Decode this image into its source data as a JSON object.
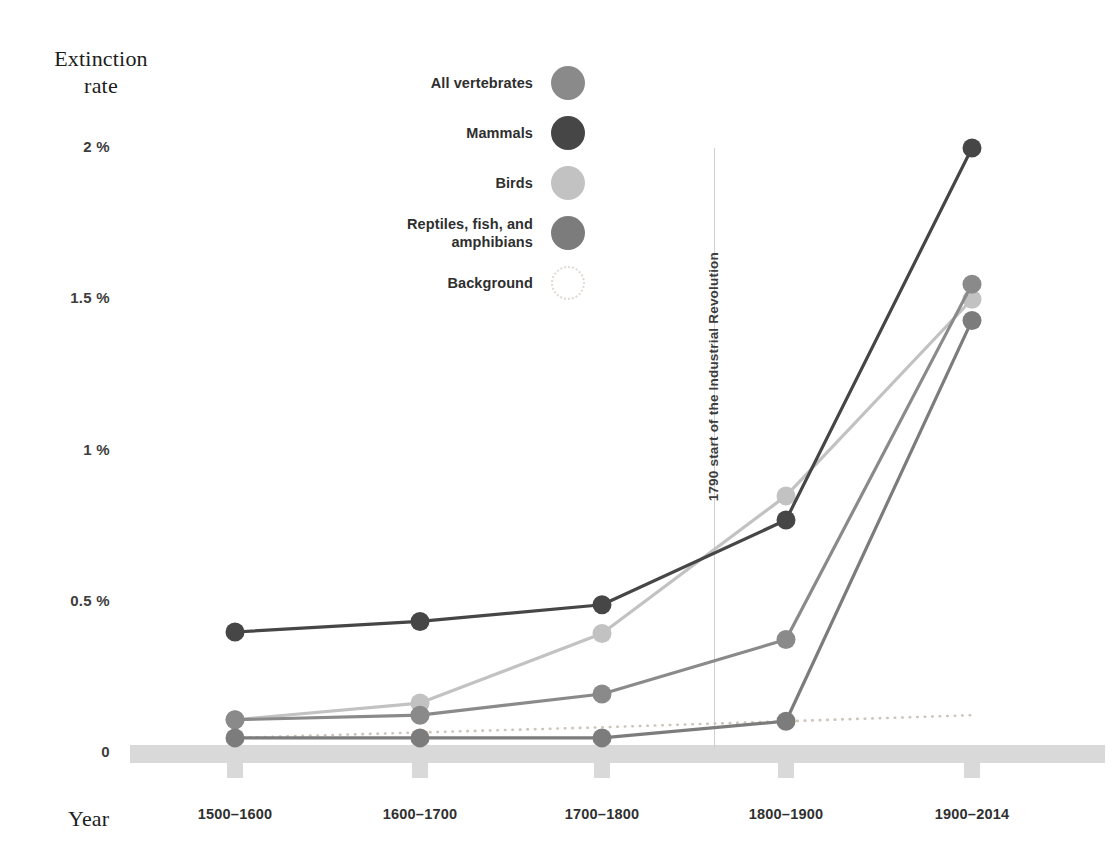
{
  "chart_data": {
    "type": "line",
    "title": "",
    "ylabel": "Extinction rate",
    "xlabel": "Year",
    "categories": [
      "1500–1600",
      "1600–1700",
      "1700–1800",
      "1800–1900",
      "1900–2014"
    ],
    "yticks": [
      "0",
      "0.5 %",
      "1 %",
      "1.5 %",
      "2 %"
    ],
    "ytick_values": [
      0,
      0.5,
      1,
      1.5,
      2
    ],
    "ylim": [
      0,
      2
    ],
    "yunit": "%",
    "grid": false,
    "legend_position": "top-center",
    "series": [
      {
        "name": "All vertebrates",
        "color": "#8a8a8a",
        "values": [
          0.11,
          0.125,
          0.195,
          0.375,
          1.55
        ]
      },
      {
        "name": "Mammals",
        "color": "#464646",
        "values": [
          0.4,
          0.435,
          0.49,
          0.77,
          2.0
        ]
      },
      {
        "name": "Birds",
        "color": "#c2c2c2",
        "values": [
          0.11,
          0.165,
          0.395,
          0.85,
          1.5
        ]
      },
      {
        "name": "Reptiles, fish, and amphibians",
        "color": "#7c7c7c",
        "values": [
          0.05,
          0.05,
          0.05,
          0.105,
          1.43
        ]
      },
      {
        "name": "Background",
        "color": "#cfc4ba",
        "style": "dotted",
        "values": [
          0.05,
          0.068,
          0.085,
          0.105,
          0.125
        ]
      }
    ],
    "annotations": [
      {
        "name": "industrial-revolution",
        "text": "1790 start of the Industrial Revolution",
        "x_position": 1790,
        "orientation": "vertical"
      }
    ]
  },
  "axis": {
    "y_title_line1": "Extinction",
    "y_title_line2": "rate",
    "x_title": "Year"
  },
  "legend": {
    "items": [
      {
        "label": "All vertebrates",
        "color": "#8a8a8a",
        "style": "solid"
      },
      {
        "label": "Mammals",
        "color": "#464646",
        "style": "solid"
      },
      {
        "label": "Birds",
        "color": "#c2c2c2",
        "style": "solid"
      },
      {
        "label": "Reptiles, fish, and amphibians",
        "color": "#7c7c7c",
        "style": "solid"
      },
      {
        "label": "Background",
        "color": "#e2d9d2",
        "style": "dotted"
      }
    ]
  },
  "annotation": {
    "vline_text": "1790 start of the Industrial Revolution"
  }
}
